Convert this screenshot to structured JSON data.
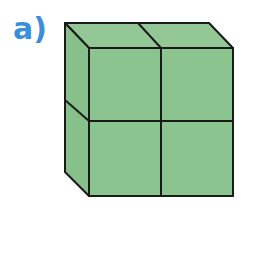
{
  "problem": {
    "label": "a)",
    "label_color": "#3a8fd8"
  },
  "figure": {
    "fill_front": "#8cc490",
    "fill_top": "#93c896",
    "fill_side": "#87c08b",
    "stroke": "#1a1a1a",
    "cubes_front_grid": {
      "rows": 2,
      "cols": 2
    },
    "depth_cubes": 1
  }
}
